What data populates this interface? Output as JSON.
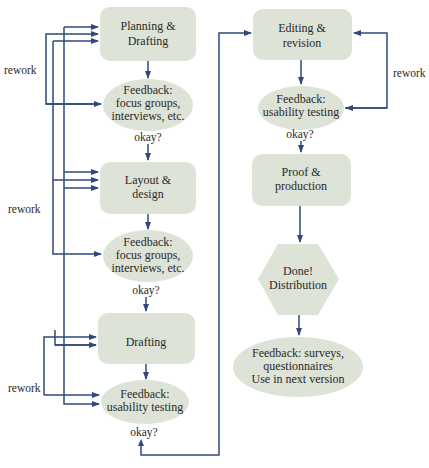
{
  "diagram": {
    "type": "flowchart",
    "colors": {
      "node_fill": "#dde3d6",
      "connector": "#2f4a7a",
      "text": "#2a2a2a"
    },
    "nodes": [
      {
        "id": "planning",
        "shape": "rounded-rect",
        "lines": [
          "Planning &",
          "Drafting"
        ]
      },
      {
        "id": "feedback1",
        "shape": "ellipse",
        "lines": [
          "Feedback:",
          "focus groups,",
          "interviews, etc."
        ]
      },
      {
        "id": "layout",
        "shape": "rounded-rect",
        "lines": [
          "Layout &",
          "design"
        ]
      },
      {
        "id": "feedback2",
        "shape": "ellipse",
        "lines": [
          "Feedback:",
          "focus groups,",
          "interviews, etc."
        ]
      },
      {
        "id": "drafting",
        "shape": "rounded-rect",
        "lines": [
          "Drafting"
        ]
      },
      {
        "id": "feedback3",
        "shape": "ellipse",
        "lines": [
          "Feedback:",
          "usability testing"
        ]
      },
      {
        "id": "editing",
        "shape": "rounded-rect",
        "lines": [
          "Editing &",
          "revision"
        ]
      },
      {
        "id": "feedback4",
        "shape": "ellipse",
        "lines": [
          "Feedback:",
          "usability testing"
        ]
      },
      {
        "id": "proof",
        "shape": "rounded-rect",
        "lines": [
          "Proof &",
          "production"
        ]
      },
      {
        "id": "done",
        "shape": "hexagon",
        "lines": [
          "Done!",
          "Distribution"
        ]
      },
      {
        "id": "feedback5",
        "shape": "ellipse",
        "lines": [
          "Feedback: surveys,",
          "questionnaires",
          "Use in next version"
        ]
      }
    ],
    "labels": {
      "okay": "okay?",
      "rework": "rework"
    },
    "edges": [
      {
        "from": "planning",
        "to": "feedback1"
      },
      {
        "from": "feedback1",
        "to": "layout",
        "label": "okay?"
      },
      {
        "from": "layout",
        "to": "feedback2"
      },
      {
        "from": "feedback2",
        "to": "drafting",
        "label": "okay?"
      },
      {
        "from": "drafting",
        "to": "feedback3"
      },
      {
        "from": "feedback3",
        "to": "editing",
        "label": "okay?"
      },
      {
        "from": "editing",
        "to": "feedback4"
      },
      {
        "from": "feedback4",
        "to": "proof",
        "label": "okay?"
      },
      {
        "from": "proof",
        "to": "done"
      },
      {
        "from": "done",
        "to": "feedback5"
      },
      {
        "from": "feedback1",
        "to": "planning",
        "label": "rework"
      },
      {
        "from": "feedback2",
        "to": "planning",
        "label": "rework"
      },
      {
        "from": "feedback2",
        "to": "layout",
        "label": "rework"
      },
      {
        "from": "feedback3",
        "to": "planning",
        "label": "rework"
      },
      {
        "from": "feedback3",
        "to": "layout",
        "label": "rework"
      },
      {
        "from": "feedback3",
        "to": "drafting",
        "label": "rework"
      },
      {
        "from": "feedback4",
        "to": "editing",
        "label": "rework"
      }
    ]
  }
}
